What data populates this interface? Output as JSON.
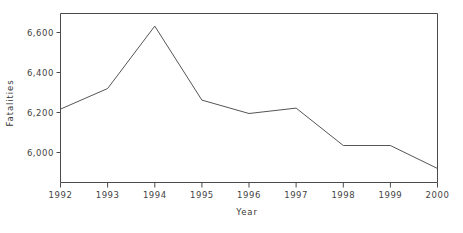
{
  "chart_data": {
    "type": "line",
    "title": "",
    "subtitle": "",
    "xlabel": "Year",
    "ylabel": "Fatalities",
    "x": [
      1992,
      1993,
      1994,
      1995,
      1996,
      1997,
      1998,
      1999,
      2000
    ],
    "categories": [
      "1992",
      "1993",
      "1994",
      "1995",
      "1996",
      "1997",
      "1998",
      "1999",
      "2000"
    ],
    "values": [
      6217,
      6320,
      6632,
      6262,
      6195,
      6222,
      6035,
      6035,
      5920
    ],
    "series": [
      {
        "name": "Fatalities",
        "values": [
          6217,
          6320,
          6632,
          6262,
          6195,
          6222,
          6035,
          6035,
          5920
        ]
      }
    ],
    "xlim": [
      1992,
      2000
    ],
    "ylim": [
      5860,
      6700
    ],
    "xticks": [
      1992,
      1993,
      1994,
      1995,
      1996,
      1997,
      1998,
      1999,
      2000
    ],
    "yticks": [
      6000,
      6200,
      6400,
      6600
    ],
    "ytick_labels": [
      "6,000",
      "6,200",
      "6,400",
      "6,600"
    ],
    "xtick_labels": [
      "1992",
      "1993",
      "1994",
      "1995",
      "1996",
      "1997",
      "1998",
      "1999",
      "2000"
    ],
    "grid": false,
    "legend": false,
    "legend_position": "none",
    "line_color": "#555555",
    "axis_color": "#333333",
    "background_color": "#ffffff",
    "markers": false,
    "annotations": []
  },
  "axis": {
    "y_title": "Fatalities",
    "x_title": "Year"
  }
}
